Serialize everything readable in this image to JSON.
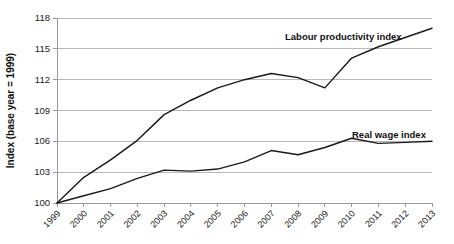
{
  "chart_data": {
    "type": "line",
    "title": "",
    "xlabel": "",
    "ylabel": "Index (base year = 1999)",
    "ylim": [
      100,
      118
    ],
    "yticks": [
      100,
      103,
      106,
      109,
      112,
      115,
      118
    ],
    "grid": true,
    "legend_position": "inline-annotation",
    "categories": [
      "1999",
      "2000",
      "2001",
      "2002",
      "2003",
      "2004",
      "2005",
      "2006",
      "2007",
      "2008",
      "2009",
      "2010",
      "2011",
      "2012",
      "2013"
    ],
    "series": [
      {
        "name": "Labour productivity  index",
        "values": [
          100,
          102.5,
          104.2,
          106.1,
          108.6,
          110.0,
          111.2,
          112.0,
          112.6,
          112.2,
          111.2,
          114.1,
          115.2,
          116.1,
          117.0
        ]
      },
      {
        "name": "Real wage index",
        "values": [
          100,
          100.7,
          101.4,
          102.4,
          103.2,
          103.1,
          103.3,
          104.0,
          105.1,
          104.7,
          105.4,
          106.3,
          105.8,
          105.9,
          106.0
        ]
      }
    ],
    "annotations": [
      {
        "text": "Labour productivity  index",
        "x": 285,
        "y": 40
      },
      {
        "text": "Real wage index",
        "x": 352,
        "y": 138
      }
    ]
  }
}
